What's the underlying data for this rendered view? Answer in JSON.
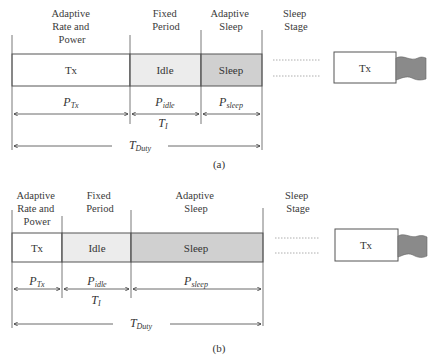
{
  "colors": {
    "tx_fill": "#ffffff",
    "idle_fill": "#ececec",
    "sleep_fill": "#d0d0d0",
    "flag_fill": "#8a8a8a",
    "stroke": "#555555"
  },
  "diagrams": [
    {
      "caption": "(a)",
      "headers": {
        "tx": [
          "Adaptive",
          "Rate and",
          "Power"
        ],
        "idle": [
          "Fixed",
          "Period"
        ],
        "sleep": [
          "Adaptive",
          "Sleep"
        ],
        "stage": [
          "Sleep",
          "Stage"
        ]
      },
      "cells": {
        "tx": "Tx",
        "idle": "Idle",
        "sleep": "Sleep",
        "next_tx": "Tx"
      },
      "power_labels": {
        "tx": {
          "main": "P",
          "sub": "Tx"
        },
        "idle": {
          "main": "P",
          "sub": "idle"
        },
        "sleep": {
          "main": "P",
          "sub": "sleep"
        }
      },
      "interval_label": {
        "main": "T",
        "sub": "I"
      },
      "duty_label": {
        "main": "T",
        "sub": "Duty"
      }
    },
    {
      "caption": "(b)",
      "headers": {
        "tx": [
          "Adaptive",
          "Rate and",
          "Power"
        ],
        "idle": [
          "Fixed",
          "Period"
        ],
        "sleep": [
          "Adaptive",
          "Sleep"
        ],
        "stage": [
          "Sleep",
          "Stage"
        ]
      },
      "cells": {
        "tx": "Tx",
        "idle": "Idle",
        "sleep": "Sleep",
        "next_tx": "Tx"
      },
      "power_labels": {
        "tx": {
          "main": "P",
          "sub": "Tx"
        },
        "idle": {
          "main": "P",
          "sub": "idle"
        },
        "sleep": {
          "main": "P",
          "sub": "sleep"
        }
      },
      "interval_label": {
        "main": "T",
        "sub": "I"
      },
      "duty_label": {
        "main": "T",
        "sub": "Duty"
      }
    }
  ]
}
